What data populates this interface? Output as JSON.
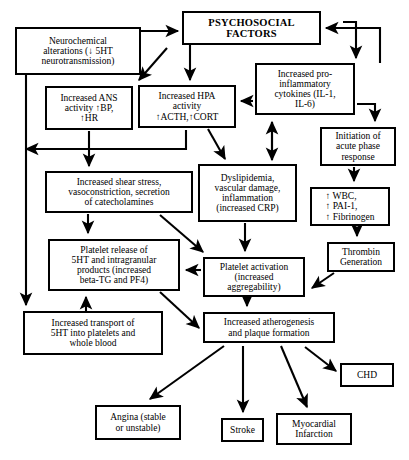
{
  "diagram": {
    "style": {
      "line_color": "#000000",
      "box_fill": "#ffffff",
      "text_color": "#000000"
    },
    "nodes": [
      {
        "id": "psychosocial-factors",
        "label": "PSYCHOSOCIAL\nFACTORS",
        "x": 182,
        "y": 11,
        "w": 139,
        "h": 34,
        "bold": true
      },
      {
        "id": "neurochemical-alterations",
        "label": "Neurochemical\nalterations (↓ 5HT\nneurotransmission)",
        "x": 15,
        "y": 27,
        "w": 126,
        "h": 48
      },
      {
        "id": "increased-cytokines",
        "label": "Increased pro-\ninflammatory\ncytokines (IL-1,\nIL-6)",
        "x": 255,
        "y": 63,
        "w": 100,
        "h": 52
      },
      {
        "id": "increased-ans-activity",
        "label": "Increased ANS\nactivity ↑BP,\n↑HR",
        "x": 45,
        "y": 86,
        "w": 88,
        "h": 44
      },
      {
        "id": "increased-hpa-activity",
        "label": "Increased HPA\nactivity\n↑ACTH,↑CORT",
        "x": 138,
        "y": 85,
        "w": 98,
        "h": 43
      },
      {
        "id": "acute-phase-response",
        "label": "Initiation of\nacute phase\nresponse",
        "x": 320,
        "y": 127,
        "w": 76,
        "h": 39
      },
      {
        "id": "dyslipidemia",
        "label": "Dyslipidemia,\nvascular damage,\ninflammation\n(increased CRP)",
        "x": 198,
        "y": 164,
        "w": 99,
        "h": 58
      },
      {
        "id": "increased-shear-stress",
        "label": "Increased shear stress,\nvasoconstriction, secretion\nof catecholamines",
        "x": 45,
        "y": 171,
        "w": 148,
        "h": 42
      },
      {
        "id": "wbc-pai1-fibrinogen",
        "label": "↑ WBC,\n↑ PAI-1,\n↑ Fibrinogen",
        "x": 310,
        "y": 187,
        "w": 80,
        "h": 39,
        "align": "left"
      },
      {
        "id": "thrombin-generation",
        "label": "Thrombin\nGeneration",
        "x": 327,
        "y": 242,
        "w": 68,
        "h": 30
      },
      {
        "id": "platelet-release",
        "label": "Platelet release of\n5HT and intragranular\nproducts (increased\nbeta-TG and PF4)",
        "x": 48,
        "y": 239,
        "w": 132,
        "h": 52
      },
      {
        "id": "platelet-activation",
        "label": "Platelet activation\n(increased\naggregability)",
        "x": 203,
        "y": 257,
        "w": 102,
        "h": 40
      },
      {
        "id": "increased-transport-5ht",
        "label": "Increased transport of\n5HT into platelets and\nwhole blood",
        "x": 23,
        "y": 311,
        "w": 140,
        "h": 44
      },
      {
        "id": "increased-atherogenesis",
        "label": "Increased atherogenesis\nand plaque formation",
        "x": 203,
        "y": 312,
        "w": 132,
        "h": 31
      },
      {
        "id": "chd",
        "label": "CHD",
        "x": 340,
        "y": 363,
        "w": 54,
        "h": 24
      },
      {
        "id": "angina",
        "label": "Angina (stable\nor unstable)",
        "x": 95,
        "y": 405,
        "w": 86,
        "h": 35
      },
      {
        "id": "stroke",
        "label": "Stroke",
        "x": 221,
        "y": 418,
        "w": 43,
        "h": 24
      },
      {
        "id": "myocardial-infarction",
        "label": "Myocardial\nInfarction",
        "x": 276,
        "y": 413,
        "w": 76,
        "h": 32
      }
    ],
    "edges": [
      {
        "id": "neurochemical-to-psychosocial",
        "from": "neurochemical-alterations",
        "to": "psychosocial-factors"
      },
      {
        "id": "psychosocial-to-hpa",
        "from": "psychosocial-factors",
        "to": "increased-hpa-activity"
      },
      {
        "id": "psychosocial-to-ans",
        "from": "psychosocial-factors",
        "to": "increased-ans-activity"
      },
      {
        "id": "psychosocial-to-cytokines",
        "from": "psychosocial-factors",
        "to": "increased-cytokines"
      },
      {
        "id": "cytokines-to-psychosocial",
        "from": "increased-cytokines",
        "to": "psychosocial-factors"
      },
      {
        "id": "cytokines-to-hpa",
        "from": "increased-cytokines",
        "to": "increased-hpa-activity"
      },
      {
        "id": "cytokines-to-acute-phase",
        "from": "increased-cytokines",
        "to": "acute-phase-response"
      },
      {
        "id": "acute-phase-to-wbc",
        "from": "acute-phase-response",
        "to": "wbc-pai1-fibrinogen"
      },
      {
        "id": "wbc-to-thrombin",
        "from": "wbc-pai1-fibrinogen",
        "to": "thrombin-generation"
      },
      {
        "id": "thrombin-to-platelet-activation",
        "from": "thrombin-generation",
        "to": "platelet-activation"
      },
      {
        "id": "ans-to-shear-stress",
        "from": "increased-ans-activity",
        "to": "increased-shear-stress"
      },
      {
        "id": "ans-to-neurochemical-feedback",
        "from": "increased-ans-activity",
        "to": "neurochemical-alterations"
      },
      {
        "id": "hpa-to-dyslipidemia",
        "from": "increased-hpa-activity",
        "to": "dyslipidemia"
      },
      {
        "id": "dyslipidemia-to-cytokines",
        "from": "dyslipidemia",
        "to": "increased-cytokines"
      },
      {
        "id": "dyslipidemia-to-platelet-activation",
        "from": "dyslipidemia",
        "to": "platelet-activation"
      },
      {
        "id": "shear-stress-to-platelet-release",
        "from": "increased-shear-stress",
        "to": "platelet-release"
      },
      {
        "id": "shear-stress-to-platelet-activation",
        "from": "increased-shear-stress",
        "to": "platelet-activation"
      },
      {
        "id": "platelet-activation-to-platelet-release",
        "from": "platelet-activation",
        "to": "platelet-release"
      },
      {
        "id": "platelet-activation-to-atherogenesis",
        "from": "platelet-activation",
        "to": "increased-atherogenesis"
      },
      {
        "id": "platelet-release-to-atherogenesis",
        "from": "platelet-release",
        "to": "increased-atherogenesis"
      },
      {
        "id": "transport-to-platelet-release",
        "from": "increased-transport-5ht",
        "to": "platelet-release"
      },
      {
        "id": "neurochemical-to-transport",
        "from": "neurochemical-alterations",
        "to": "increased-transport-5ht"
      },
      {
        "id": "atherogenesis-to-angina",
        "from": "increased-atherogenesis",
        "to": "angina"
      },
      {
        "id": "atherogenesis-to-stroke",
        "from": "increased-atherogenesis",
        "to": "stroke"
      },
      {
        "id": "atherogenesis-to-mi",
        "from": "increased-atherogenesis",
        "to": "myocardial-infarction"
      },
      {
        "id": "atherogenesis-to-chd",
        "from": "increased-atherogenesis",
        "to": "chd"
      }
    ]
  }
}
